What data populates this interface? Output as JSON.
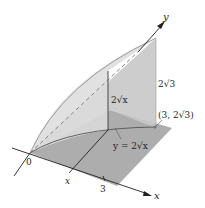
{
  "figure": {
    "axes": {
      "x_label": "x",
      "y_label": "y",
      "origin_label": "0"
    },
    "ticks": {
      "x_variable": "x",
      "x_end": "3"
    },
    "annotations": {
      "height_at_end": "2√3",
      "height_at_x": "2√x",
      "curve_equation": "y = 2√x",
      "endpoint": "(3, 2√3)"
    },
    "colors": {
      "base_plane": "#9a9a9a",
      "vertical_wall": "#c4c4c4",
      "curved_surface": "#d6d6d6",
      "lines": "#231f20",
      "background": "#ffffff"
    }
  }
}
